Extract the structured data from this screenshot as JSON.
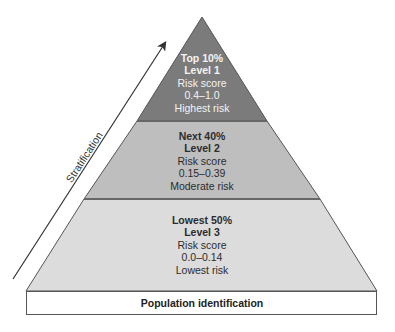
{
  "diagram": {
    "axis_label": "Stratification",
    "base_label": "Population identification",
    "colors": {
      "tier1": "#7b7b7b",
      "tier2": "#bebebe",
      "tier3": "#dcdcdc",
      "base": "#ffffff",
      "outline": "#555555"
    },
    "tiers": [
      {
        "share": "Top 10%",
        "level": "Level 1",
        "score_label": "Risk score",
        "score_range": "0.4–1.0",
        "risk": "Highest risk"
      },
      {
        "share": "Next 40%",
        "level": "Level 2",
        "score_label": "Risk score",
        "score_range": "0.15–0.39",
        "risk": "Moderate risk"
      },
      {
        "share": "Lowest 50%",
        "level": "Level 3",
        "score_label": "Risk score",
        "score_range": "0.0–0.14",
        "risk": "Lowest risk"
      }
    ]
  }
}
